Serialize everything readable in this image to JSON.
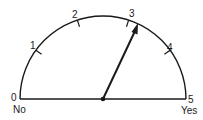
{
  "gauge": {
    "center": [
      103,
      99
    ],
    "radius": 83,
    "min": 0,
    "max": 5,
    "value": 3.2,
    "stroke_color": "#1a1a1a",
    "ticks": [
      {
        "label": "0",
        "value": 0
      },
      {
        "label": "1",
        "value": 1
      },
      {
        "label": "2",
        "value": 2
      },
      {
        "label": "3",
        "value": 3
      },
      {
        "label": "4",
        "value": 4
      },
      {
        "label": "5",
        "value": 5
      }
    ],
    "end_labels": {
      "left": "No",
      "right": "Yes"
    }
  }
}
